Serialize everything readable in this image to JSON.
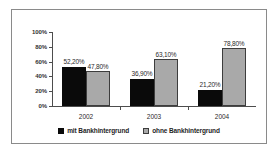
{
  "chart_data": {
    "type": "bar",
    "title": "",
    "subtitle": "",
    "xlabel": "",
    "ylabel": "",
    "categories": [
      "2002",
      "2003",
      "2004"
    ],
    "series": [
      {
        "name": "mit Bankhintergrund",
        "color": "#0a0a0a",
        "values": [
          52.2,
          47.8,
          36.9
        ],
        "labels": [
          "52,20%",
          "36,90%",
          "21,20%"
        ],
        "series_values": [
          52.2,
          36.9,
          21.2
        ]
      },
      {
        "name": "ohne Bankhintergrund",
        "color": "#a9a9a9",
        "values": [
          47.8,
          63.1,
          78.8
        ],
        "labels": [
          "47,80%",
          "63,10%",
          "78,80%"
        ],
        "series_values": [
          47.8,
          63.1,
          78.8
        ]
      }
    ],
    "ylim": [
      0,
      100
    ],
    "ytick_values": [
      0,
      20,
      40,
      60,
      80,
      100
    ],
    "ytick_labels": [
      "0%",
      "20%",
      "40%",
      "60%",
      "80%",
      "100%"
    ],
    "grid": false,
    "legend_position": "bottom",
    "bars": [
      {
        "category": "2002",
        "series": "mit Bankhintergrund",
        "value": 52.2,
        "label": "52,20%"
      },
      {
        "category": "2002",
        "series": "ohne Bankhintergrund",
        "value": 47.8,
        "label": "47,80%"
      },
      {
        "category": "2003",
        "series": "mit Bankhintergrund",
        "value": 36.9,
        "label": "36,90%"
      },
      {
        "category": "2003",
        "series": "ohne Bankhintergrund",
        "value": 63.1,
        "label": "63,10%"
      },
      {
        "category": "2004",
        "series": "mit Bankhintergrund",
        "value": 21.2,
        "label": "21,20%"
      },
      {
        "category": "2004",
        "series": "ohne Bankhintergrund",
        "value": 78.8,
        "label": "78,80%"
      }
    ]
  },
  "legend": {
    "items": [
      {
        "label": "mit Bankhintergrund",
        "swatch": "black-square-icon"
      },
      {
        "label": "ohne Bankhintergrund",
        "swatch": "gray-square-icon"
      }
    ]
  },
  "colors": {
    "series_mit": "#0a0a0a",
    "series_ohne": "#a9a9a9",
    "axis": "#4d4d4d",
    "frame": "#8a8a8a",
    "background": "#ffffff"
  }
}
